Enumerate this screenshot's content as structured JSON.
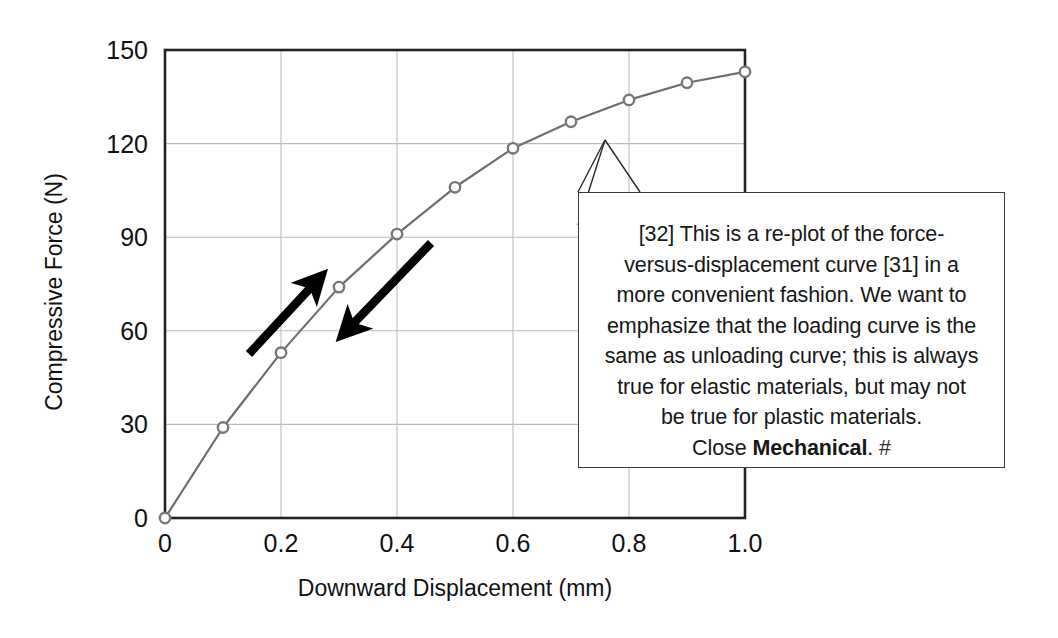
{
  "chart_data": {
    "type": "line",
    "title": "",
    "xlabel": "Downward Displacement (mm)",
    "ylabel": "Compressive Force (N)",
    "xlim": [
      0,
      1.0
    ],
    "ylim": [
      0,
      150
    ],
    "xticks": [
      "0",
      "0.2",
      "0.4",
      "0.6",
      "0.8",
      "1.0"
    ],
    "xtick_values": [
      0,
      0.2,
      0.4,
      0.6,
      0.8,
      1.0
    ],
    "yticks": [
      "0",
      "30",
      "60",
      "90",
      "120",
      "150"
    ],
    "ytick_values": [
      0,
      30,
      60,
      90,
      120,
      150
    ],
    "grid": true,
    "legend": "none",
    "series": [
      {
        "name": "Compressive force vs downward displacement",
        "marker": "open-circle",
        "line_color": "#6e6e6e",
        "marker_color": "#777777",
        "x": [
          0,
          0.1,
          0.2,
          0.3,
          0.4,
          0.5,
          0.6,
          0.7,
          0.8,
          0.9,
          1.0
        ],
        "values": [
          0,
          29,
          53,
          74,
          91,
          106,
          118.5,
          127,
          134,
          139.5,
          143
        ]
      }
    ],
    "annotations": [
      {
        "name": "loading-arrow",
        "label": "loading direction arrow",
        "direction": "up-right",
        "from": [
          0.145,
          57
        ],
        "to": [
          0.262,
          79
        ]
      },
      {
        "name": "unloading-arrow",
        "label": "unloading direction arrow",
        "direction": "down-left",
        "from": [
          0.458,
          88
        ],
        "to": [
          0.311,
          62
        ]
      }
    ]
  },
  "axes": {
    "x_title": "Downward Displacement (mm)",
    "y_title": "Compressive Force (N)",
    "x_ticks": [
      "0",
      "0.2",
      "0.4",
      "0.6",
      "0.8",
      "1.0"
    ],
    "y_ticks": [
      "0",
      "30",
      "60",
      "90",
      "120",
      "150"
    ]
  },
  "callout": {
    "lines": [
      "[32] This is a re-plot of the force-",
      "versus-displacement curve [31] in a",
      "more convenient fashion. We want to",
      "emphasize that the loading curve is the",
      "same as unloading curve; this is always",
      "true for elastic materials, but may not",
      "be true for plastic materials."
    ],
    "last_line_prefix": "Close ",
    "last_line_bold": "Mechanical",
    "last_line_suffix": ". ",
    "last_line_hash": "#",
    "full_text": "[32] This is a re-plot of the force-versus-displacement curve [31] in a more convenient fashion. We want to emphasize that the loading curve is the same as unloading curve; this is always true for elastic materials, but may not be true for plastic materials. Close Mechanical. #"
  },
  "colors": {
    "axis": "#222222",
    "grid": "#bdbdbd",
    "curve": "#6e6e6e",
    "marker_stroke": "#787878",
    "marker_fill": "#ffffff",
    "arrow": "#000000",
    "callout_border": "#3a3a3a",
    "background": "#ffffff"
  }
}
